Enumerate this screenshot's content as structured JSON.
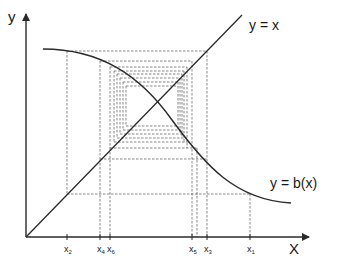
{
  "diagram": {
    "type": "cobweb",
    "axes": {
      "y_label": "y",
      "x_label": "X",
      "origin": [
        26,
        237
      ],
      "x_end": [
        309,
        237
      ],
      "y_end": [
        26,
        14
      ]
    },
    "identity_line": {
      "label": "y = x",
      "from": [
        26,
        237
      ],
      "to": [
        242,
        15
      ],
      "label_pos": [
        249,
        30
      ]
    },
    "curve": {
      "label": "y = b(x)",
      "label_pos": [
        270,
        188
      ],
      "path": "M43,49 C100,49 140,75 172,120 C205,165 235,200 291,203"
    },
    "ticks": [
      {
        "base": "x",
        "sub": "2",
        "x": 67
      },
      {
        "base": "x",
        "sub": "4",
        "x": 100
      },
      {
        "base": "x",
        "sub": "6",
        "x": 110
      },
      {
        "base": "x",
        "sub": "5",
        "x": 192
      },
      {
        "base": "x",
        "sub": "3",
        "x": 207
      },
      {
        "base": "x",
        "sub": "1",
        "x": 250
      }
    ],
    "dashed_lines": [
      [
        67,
        51,
        207,
        51
      ],
      [
        67,
        51,
        67,
        194
      ],
      [
        67,
        194,
        250,
        194
      ],
      [
        250,
        194,
        250,
        237
      ],
      [
        207,
        51,
        207,
        237
      ],
      [
        100,
        61,
        192,
        61
      ],
      [
        100,
        61,
        100,
        159
      ],
      [
        100,
        159,
        207,
        159
      ],
      [
        192,
        61,
        192,
        237
      ],
      [
        100,
        159,
        100,
        237
      ],
      [
        110,
        67,
        187,
        67
      ],
      [
        110,
        67,
        110,
        148
      ],
      [
        110,
        148,
        197,
        148
      ],
      [
        187,
        67,
        187,
        148
      ],
      [
        110,
        148,
        110,
        237
      ],
      [
        197,
        148,
        197,
        237
      ],
      [
        114,
        71,
        184,
        71
      ],
      [
        114,
        71,
        114,
        142
      ],
      [
        114,
        142,
        190,
        142
      ],
      [
        184,
        71,
        184,
        142
      ],
      [
        117,
        74,
        182,
        74
      ],
      [
        117,
        74,
        117,
        138
      ],
      [
        117,
        138,
        187,
        138
      ],
      [
        182,
        74,
        182,
        138
      ],
      [
        120,
        78,
        180,
        78
      ],
      [
        120,
        78,
        120,
        134
      ],
      [
        120,
        134,
        184,
        134
      ],
      [
        180,
        78,
        180,
        134
      ],
      [
        123,
        82,
        178,
        82
      ],
      [
        123,
        82,
        123,
        130
      ],
      [
        123,
        130,
        181,
        130
      ],
      [
        178,
        82,
        178,
        130
      ],
      [
        126,
        86,
        176,
        86
      ],
      [
        126,
        86,
        126,
        126
      ],
      [
        126,
        126,
        178,
        126
      ]
    ],
    "colors": {
      "line": "#2a2a2a",
      "dash": "#555555",
      "background": "#ffffff"
    }
  }
}
